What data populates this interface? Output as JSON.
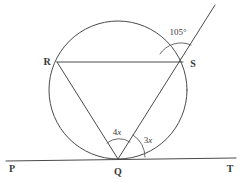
{
  "figure": {
    "type": "circle-geometry-diagram",
    "background_color": "#ffffff",
    "line_color": "#4a4a4a",
    "label_color": "#3a3a3a"
  },
  "points": [
    {
      "name": "P",
      "label": "P",
      "x": 9,
      "y": 168,
      "label_x": 9,
      "label_y": 172
    },
    {
      "name": "Q",
      "label": "Q",
      "x": 118,
      "y": 159,
      "label_x": 118,
      "label_y": 175
    },
    {
      "name": "R",
      "label": "R",
      "x": 57,
      "y": 62,
      "label_x": 47,
      "label_y": 65
    },
    {
      "name": "S",
      "label": "S",
      "x": 183,
      "y": 62,
      "label_x": 193,
      "label_y": 67
    },
    {
      "name": "T",
      "label": "T",
      "x": 230,
      "y": 168,
      "label_x": 230,
      "label_y": 172
    }
  ],
  "circle": {
    "center_x": 118,
    "center_y": 90,
    "radius": 69
  },
  "segments": [
    {
      "name": "tangent-line-PT",
      "x1": 6,
      "y1": 161,
      "x2": 236,
      "y2": 158
    },
    {
      "name": "chord-RS",
      "x1": 57,
      "y1": 62,
      "x2": 183,
      "y2": 62
    },
    {
      "name": "chord-QR",
      "x1": 118,
      "y1": 159,
      "x2": 57,
      "y2": 62
    },
    {
      "name": "ray-QS-extended",
      "x1": 118,
      "y1": 159,
      "x2": 215,
      "y2": 5
    }
  ],
  "angles": [
    {
      "name": "angle-105-at-S",
      "value": "105",
      "unit": "°",
      "vertex": "S",
      "label_x": 178,
      "label_y": 35
    },
    {
      "name": "angle-4x-at-Q",
      "coefficient": "4",
      "variable": "x",
      "vertex": "Q",
      "label_x": 117,
      "label_y": 135
    },
    {
      "name": "angle-3x-at-Q",
      "coefficient": "3",
      "variable": "x",
      "vertex": "Q",
      "label_x": 148,
      "label_y": 143
    }
  ]
}
